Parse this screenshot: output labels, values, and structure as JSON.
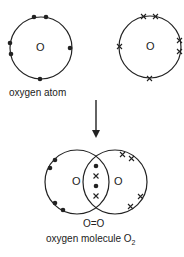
{
  "atom1": {
    "symbol": "O",
    "electron_marker": "dot",
    "outer_electrons": 6
  },
  "atom2": {
    "symbol": "O",
    "electron_marker": "cross",
    "outer_electrons": 6
  },
  "atom_label": "oxygen atom",
  "arrow": "down-arrow",
  "molecule": {
    "left_symbol": "O",
    "right_symbol": "O",
    "shared_electrons": [
      "dot",
      "cross",
      "dot",
      "cross"
    ],
    "structural_formula": "O=O",
    "label_prefix": "oxygen molecule O",
    "label_subscript": "2"
  },
  "colors": {
    "line": "#222222",
    "background": "#ffffff"
  }
}
